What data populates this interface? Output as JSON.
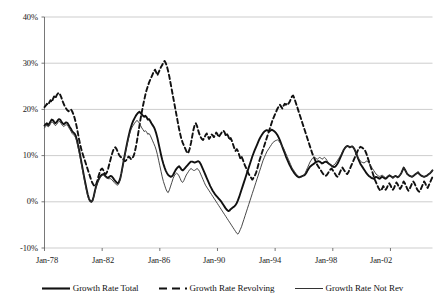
{
  "chart_data": {
    "type": "line",
    "title": "",
    "subtitle": "",
    "xlabel": "",
    "ylabel": "",
    "grid": true,
    "legend_position": "bottom",
    "ylim": [
      -10,
      40
    ],
    "xlim": [
      "Jan-78",
      "Dec-04"
    ],
    "y_ticks": [
      40,
      30,
      20,
      10,
      0,
      -10
    ],
    "y_tick_labels": [
      "40%",
      "30%",
      "20%",
      "10%",
      "0%",
      "-10%"
    ],
    "x_ticks": [
      "Jan-78",
      "Jan-82",
      "Jan-86",
      "Jan-90",
      "Jan-94",
      "Jan-98",
      "Jan-02"
    ],
    "x_start_year": 1978,
    "x_end_year": 2005,
    "points_per_year": 12,
    "series": [
      {
        "name": "Growth Rate Total",
        "style": "solid",
        "color": "#111111",
        "width": 1.9,
        "values": [
          16.5,
          16.8,
          17.0,
          16.6,
          16.9,
          17.4,
          17.8,
          17.7,
          17.3,
          17.0,
          17.2,
          17.6,
          17.9,
          17.8,
          17.4,
          17.0,
          16.8,
          17.0,
          17.2,
          17.1,
          16.7,
          16.2,
          15.8,
          15.3,
          15.0,
          14.8,
          14.3,
          13.4,
          12.2,
          11.0,
          9.6,
          8.2,
          6.8,
          5.4,
          4.1,
          2.8,
          1.6,
          0.7,
          0.2,
          0.0,
          0.3,
          1.2,
          2.4,
          3.4,
          4.2,
          4.8,
          5.3,
          5.7,
          5.9,
          6.0,
          5.8,
          5.5,
          5.3,
          5.2,
          5.4,
          5.6,
          5.5,
          5.2,
          4.8,
          4.5,
          4.2,
          4.0,
          4.3,
          5.0,
          6.2,
          7.6,
          9.0,
          10.4,
          11.7,
          13.0,
          14.2,
          15.3,
          16.2,
          17.0,
          17.6,
          18.1,
          18.6,
          19.0,
          19.3,
          19.5,
          19.2,
          18.9,
          18.6,
          18.4,
          18.6,
          18.3,
          17.8,
          17.9,
          17.5,
          17.0,
          16.6,
          16.2,
          15.6,
          14.8,
          13.8,
          12.6,
          11.4,
          10.2,
          9.1,
          8.2,
          7.4,
          6.7,
          6.2,
          5.8,
          5.6,
          5.4,
          5.5,
          5.8,
          6.3,
          6.8,
          7.2,
          7.5,
          7.7,
          7.4,
          7.0,
          6.8,
          7.0,
          7.3,
          7.6,
          7.9,
          8.2,
          8.5,
          8.7,
          8.7,
          8.6,
          8.5,
          8.6,
          8.7,
          8.8,
          8.6,
          8.2,
          7.6,
          7.0,
          6.4,
          5.8,
          5.2,
          4.6,
          4.0,
          3.4,
          2.9,
          2.4,
          2.0,
          1.6,
          1.3,
          1.0,
          0.7,
          0.4,
          0.1,
          -0.3,
          -0.7,
          -1.1,
          -1.5,
          -1.8,
          -2.0,
          -1.9,
          -1.6,
          -1.4,
          -1.2,
          -1.0,
          -0.7,
          -0.3,
          0.3,
          1.0,
          1.8,
          2.6,
          3.4,
          4.2,
          5.0,
          5.8,
          6.6,
          7.4,
          8.2,
          9.0,
          9.8,
          10.5,
          11.2,
          11.8,
          12.4,
          13.0,
          13.6,
          14.1,
          14.5,
          14.9,
          15.2,
          15.4,
          15.5,
          15.4,
          15.2,
          15.4,
          15.6,
          15.5,
          15.3,
          15.1,
          14.8,
          14.4,
          13.9,
          13.3,
          12.6,
          11.9,
          11.2,
          10.5,
          9.8,
          9.2,
          8.6,
          8.0,
          7.5,
          7.0,
          6.6,
          6.2,
          5.9,
          5.6,
          5.4,
          5.3,
          5.4,
          5.5,
          5.6,
          5.7,
          5.9,
          6.3,
          6.8,
          7.2,
          7.6,
          7.8,
          8.0,
          8.2,
          8.4,
          8.6,
          8.7,
          8.8,
          8.7,
          8.5,
          8.3,
          8.4,
          8.6,
          8.7,
          8.6,
          8.4,
          8.2,
          8.0,
          7.8,
          7.6,
          7.5,
          7.6,
          7.9,
          8.3,
          8.8,
          9.4,
          10.0,
          10.6,
          11.2,
          11.6,
          11.9,
          12.1,
          12.0,
          11.8,
          11.9,
          12.0,
          11.8,
          11.4,
          10.8,
          10.1,
          9.4,
          8.8,
          8.2,
          7.8,
          7.4,
          7.0,
          6.6,
          6.2,
          5.9,
          5.6,
          5.4,
          5.2,
          5.1,
          5.0,
          5.2,
          5.4,
          5.3,
          5.1,
          5.0,
          5.2,
          5.4,
          5.3,
          5.1,
          5.0,
          5.2,
          5.5,
          5.7,
          5.6,
          5.4,
          5.2,
          5.4,
          5.6,
          5.5,
          5.3,
          5.5,
          5.8,
          6.2,
          6.8,
          7.4,
          7.0,
          6.5,
          6.0,
          5.8,
          5.6,
          5.5,
          5.4,
          5.6,
          5.8,
          6.0,
          6.2,
          6.4,
          6.0,
          5.8,
          5.6,
          5.5,
          5.4,
          5.5,
          5.6,
          5.8,
          6.0,
          6.2,
          6.5,
          6.8
        ]
      },
      {
        "name": "Growth Rate Revolving",
        "style": "dashed",
        "color": "#111111",
        "width": 1.9,
        "values": [
          20.5,
          20.8,
          21.2,
          21.0,
          21.5,
          22.0,
          21.6,
          22.2,
          22.8,
          22.4,
          23.0,
          23.4,
          23.6,
          23.2,
          22.6,
          21.8,
          21.2,
          20.6,
          20.2,
          19.8,
          19.6,
          19.8,
          20.0,
          19.6,
          19.0,
          18.2,
          17.2,
          16.0,
          14.6,
          13.2,
          12.0,
          11.0,
          10.2,
          9.4,
          8.6,
          7.8,
          7.0,
          6.2,
          5.4,
          4.6,
          4.0,
          3.6,
          3.4,
          3.8,
          4.6,
          5.6,
          6.4,
          7.0,
          7.2,
          6.8,
          6.2,
          6.0,
          6.4,
          7.2,
          8.2,
          9.2,
          10.2,
          11.0,
          11.6,
          11.8,
          11.4,
          10.8,
          10.2,
          9.8,
          9.6,
          9.4,
          9.0,
          8.8,
          9.0,
          9.4,
          9.8,
          9.6,
          9.2,
          9.4,
          9.8,
          10.6,
          11.8,
          13.2,
          14.8,
          16.4,
          18.0,
          19.4,
          20.8,
          22.0,
          23.2,
          24.2,
          25.0,
          25.8,
          26.4,
          27.0,
          27.6,
          28.2,
          28.6,
          28.0,
          27.4,
          28.0,
          28.6,
          29.2,
          29.6,
          30.2,
          30.5,
          30.0,
          29.2,
          28.2,
          27.0,
          25.6,
          24.2,
          22.8,
          21.4,
          20.0,
          18.6,
          17.2,
          15.8,
          14.6,
          13.6,
          12.8,
          12.2,
          11.6,
          11.0,
          10.5,
          10.8,
          11.6,
          12.8,
          14.2,
          15.6,
          16.6,
          17.0,
          16.4,
          15.4,
          14.6,
          14.0,
          13.6,
          13.4,
          13.8,
          14.4,
          14.8,
          14.2,
          13.6,
          14.0,
          14.6,
          14.4,
          14.0,
          14.4,
          15.0,
          14.6,
          14.0,
          14.4,
          14.8,
          15.2,
          15.4,
          15.0,
          14.2,
          14.6,
          14.2,
          13.4,
          13.8,
          13.2,
          12.4,
          11.6,
          11.0,
          11.4,
          11.0,
          10.2,
          9.4,
          9.8,
          9.2,
          8.4,
          7.8,
          7.2,
          6.6,
          6.0,
          5.6,
          5.2,
          4.8,
          5.2,
          5.6,
          6.2,
          7.0,
          8.0,
          9.0,
          9.8,
          10.6,
          11.4,
          12.2,
          13.0,
          13.8,
          14.6,
          15.4,
          16.2,
          17.0,
          17.8,
          18.4,
          19.0,
          19.6,
          20.2,
          20.6,
          21.0,
          20.6,
          20.2,
          20.8,
          21.2,
          21.0,
          21.4,
          21.2,
          21.6,
          22.2,
          22.8,
          23.0,
          22.4,
          21.6,
          20.8,
          20.0,
          19.2,
          18.4,
          17.6,
          16.8,
          16.0,
          15.2,
          14.4,
          13.6,
          12.8,
          12.0,
          11.2,
          10.4,
          9.8,
          9.2,
          8.6,
          8.0,
          7.6,
          7.2,
          6.8,
          6.4,
          6.0,
          5.8,
          5.6,
          5.8,
          6.2,
          6.6,
          7.0,
          7.2,
          6.8,
          6.4,
          6.0,
          5.6,
          5.4,
          5.8,
          6.4,
          7.0,
          7.4,
          7.0,
          6.6,
          6.2,
          6.0,
          6.4,
          7.0,
          7.6,
          8.2,
          8.8,
          9.4,
          10.0,
          10.6,
          11.2,
          11.6,
          11.9,
          11.8,
          11.6,
          11.4,
          11.0,
          10.4,
          9.6,
          8.8,
          8.0,
          7.2,
          6.4,
          5.6,
          4.8,
          4.2,
          3.6,
          3.0,
          2.6,
          2.4,
          2.8,
          3.4,
          3.0,
          2.6,
          3.0,
          3.6,
          4.0,
          3.6,
          3.0,
          2.6,
          3.0,
          3.6,
          4.2,
          3.8,
          3.2,
          2.8,
          3.2,
          3.8,
          4.4,
          4.0,
          3.4,
          2.8,
          2.4,
          2.8,
          3.4,
          4.0,
          4.4,
          4.0,
          3.4,
          2.8,
          2.4,
          2.2,
          2.6,
          3.2,
          3.8,
          4.4,
          4.0,
          3.4,
          3.0,
          3.6,
          4.2,
          4.8,
          5.4
        ]
      },
      {
        "name": "Growth Rate Not Rev",
        "style": "solid",
        "color": "#333333",
        "width": 0.9,
        "values": [
          16.0,
          16.3,
          16.6,
          16.2,
          16.4,
          16.9,
          17.3,
          17.2,
          16.8,
          16.5,
          16.7,
          17.1,
          17.4,
          17.3,
          16.9,
          16.5,
          16.3,
          16.5,
          16.7,
          16.6,
          16.2,
          15.7,
          15.3,
          14.8,
          14.5,
          14.3,
          13.8,
          12.9,
          11.7,
          10.5,
          9.1,
          7.7,
          6.3,
          4.9,
          3.6,
          2.3,
          1.2,
          0.4,
          0.0,
          0.0,
          0.2,
          1.0,
          2.2,
          3.2,
          4.0,
          4.6,
          5.1,
          5.5,
          5.7,
          5.8,
          5.6,
          5.3,
          5.1,
          5.0,
          5.0,
          5.0,
          4.8,
          4.5,
          4.2,
          3.9,
          3.7,
          3.6,
          4.0,
          4.8,
          6.0,
          7.4,
          8.8,
          10.2,
          11.5,
          12.7,
          13.8,
          14.8,
          15.6,
          16.2,
          16.6,
          17.0,
          17.4,
          17.6,
          17.4,
          17.0,
          16.5,
          16.0,
          15.6,
          15.2,
          15.4,
          15.1,
          14.6,
          14.8,
          14.4,
          13.8,
          13.2,
          12.6,
          12.0,
          11.2,
          10.2,
          9.0,
          7.8,
          6.6,
          5.4,
          4.4,
          3.6,
          2.8,
          2.2,
          2.0,
          2.6,
          3.4,
          4.2,
          5.0,
          5.6,
          6.0,
          6.2,
          6.0,
          5.6,
          5.0,
          4.4,
          4.2,
          4.6,
          5.2,
          5.8,
          6.2,
          6.6,
          7.0,
          7.2,
          7.0,
          6.8,
          6.8,
          7.0,
          7.2,
          7.0,
          6.6,
          6.0,
          5.4,
          4.8,
          4.2,
          3.6,
          3.2,
          2.8,
          2.4,
          2.0,
          1.6,
          1.2,
          0.8,
          0.4,
          0.0,
          -0.4,
          -0.8,
          -1.2,
          -1.6,
          -2.0,
          -2.4,
          -2.8,
          -3.2,
          -3.6,
          -4.0,
          -4.4,
          -4.8,
          -5.2,
          -5.6,
          -6.0,
          -6.4,
          -6.8,
          -7.0,
          -6.6,
          -6.0,
          -5.4,
          -4.6,
          -3.8,
          -3.0,
          -2.2,
          -1.4,
          -0.6,
          0.2,
          1.0,
          1.8,
          2.6,
          3.4,
          4.2,
          5.0,
          5.8,
          6.6,
          7.4,
          8.2,
          9.0,
          9.6,
          10.2,
          10.8,
          11.2,
          11.6,
          12.0,
          12.4,
          12.8,
          13.0,
          13.2,
          13.3,
          13.4,
          13.2,
          12.8,
          12.4,
          12.0,
          11.6,
          11.0,
          10.4,
          9.8,
          9.2,
          8.6,
          8.0,
          7.4,
          7.0,
          6.6,
          6.2,
          5.9,
          5.6,
          5.4,
          5.3,
          5.4,
          5.6,
          5.8,
          6.2,
          6.8,
          7.4,
          8.0,
          8.6,
          9.0,
          9.4,
          9.6,
          9.6,
          9.4,
          9.2,
          9.4,
          9.6,
          9.5,
          9.2,
          9.4,
          9.6,
          9.4,
          9.0,
          8.6,
          8.2,
          8.0,
          7.8,
          7.8,
          8.0,
          8.2,
          8.6,
          9.0,
          9.4,
          9.8,
          10.2,
          10.8,
          11.2,
          11.6,
          11.9,
          12.1,
          12.0,
          11.8,
          11.9,
          12.0,
          11.8,
          11.4,
          10.8,
          10.2,
          9.6,
          9.2,
          8.8,
          8.6,
          8.5,
          8.4,
          8.6,
          8.8,
          8.7,
          8.4,
          8.0,
          7.6,
          7.2,
          6.8,
          6.4,
          6.0,
          5.8,
          5.6,
          5.5,
          5.6,
          5.8,
          5.6,
          5.4,
          5.2,
          5.4,
          5.6,
          5.8,
          5.6,
          5.4,
          5.2,
          5.4,
          5.6,
          5.5,
          5.3,
          5.5,
          5.8,
          6.2,
          6.8,
          7.4,
          7.0,
          6.5,
          6.0,
          5.8,
          5.6,
          5.5,
          5.4,
          5.6,
          5.8,
          6.0,
          6.2,
          6.4,
          6.0,
          5.8,
          5.6,
          5.5,
          5.4,
          5.5,
          5.6,
          5.8,
          6.0,
          6.2,
          6.5,
          6.8
        ]
      }
    ]
  },
  "legend": {
    "items": [
      {
        "label": "Growth Rate Total",
        "style": "solid-thick"
      },
      {
        "label": "Growth Rate Revolving",
        "style": "dashed"
      },
      {
        "label": "Growth Rate Not Rev",
        "style": "solid-thin"
      }
    ]
  },
  "axes": {
    "y_labels": [
      "40%",
      "30%",
      "20%",
      "10%",
      "0%",
      "-10%"
    ],
    "x_labels": [
      "Jan-78",
      "Jan-82",
      "Jan-86",
      "Jan-90",
      "Jan-94",
      "Jan-98",
      "Jan-02"
    ]
  },
  "colors": {
    "line": "#111111",
    "thin_line": "#333333",
    "grid": "#b8b8b8",
    "axis": "#555555",
    "background": "#ffffff",
    "text": "#1a1a1a"
  }
}
